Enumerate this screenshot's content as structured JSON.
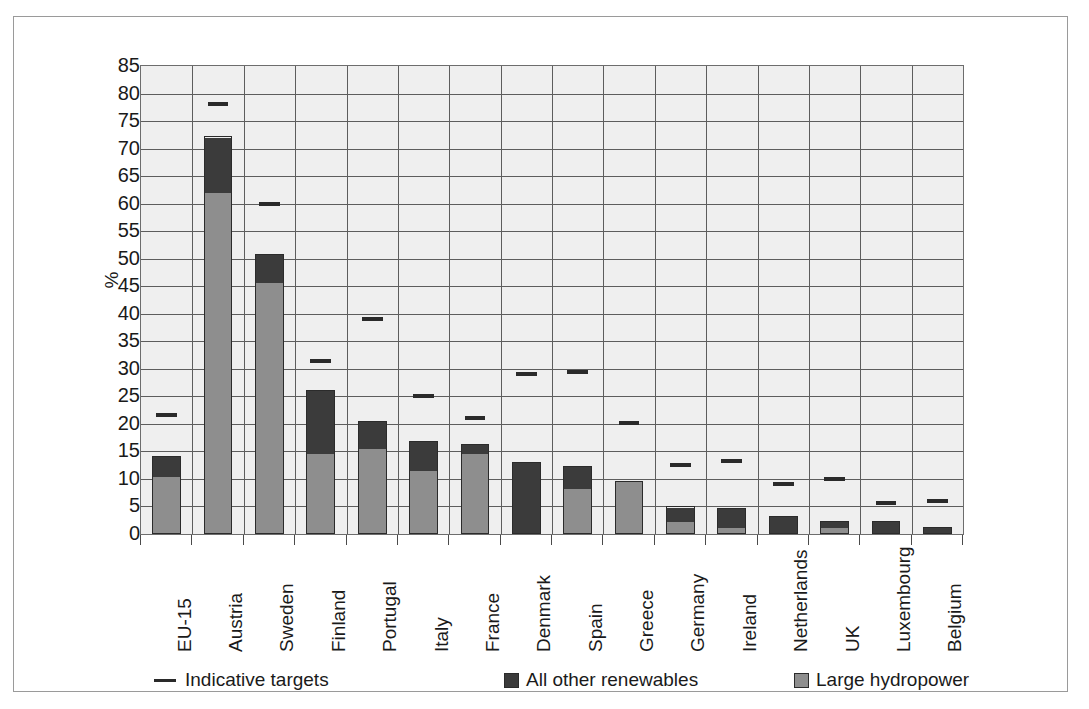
{
  "figure": {
    "ylabel": "%",
    "border_color": "#9a9a9a",
    "plot_bg": "#efefef"
  },
  "legend": {
    "items": [
      {
        "label": "Indicative targets",
        "marker": "line",
        "color": "#2a2a2a",
        "icon": "line-marker-icon"
      },
      {
        "label": "All other renewables",
        "marker": "box",
        "color": "#3b3b3b",
        "icon": "square-swatch-icon"
      },
      {
        "label": "Large hydropower",
        "marker": "box",
        "color": "#8e8e8e",
        "icon": "square-swatch-icon"
      }
    ]
  },
  "chart_data": {
    "type": "bar",
    "title": "",
    "subtitle": "",
    "xlabel": "",
    "ylabel": "%",
    "ylim": [
      0,
      85
    ],
    "ytick_step": 5,
    "yticks": [
      0,
      5,
      10,
      15,
      20,
      25,
      30,
      35,
      40,
      45,
      50,
      55,
      60,
      65,
      70,
      75,
      80,
      85
    ],
    "grid": true,
    "grid_axis": "y",
    "legend_position": "bottom",
    "stacked": true,
    "categories": [
      "EU-15",
      "Austria",
      "Sweden",
      "Finland",
      "Portugal",
      "Italy",
      "France",
      "Denmark",
      "Spain",
      "Greece",
      "Germany",
      "Ireland",
      "Netherlands",
      "UK",
      "Luxembourg",
      "Belgium"
    ],
    "series": [
      {
        "name": "Large hydropower",
        "color": "#8e8e8e",
        "values": [
          10.4,
          62.0,
          45.8,
          14.5,
          15.6,
          11.5,
          14.7,
          0.0,
          8.3,
          9.6,
          2.1,
          1.0,
          0.0,
          1.0,
          0.0,
          0.0
        ]
      },
      {
        "name": "All other renewables",
        "color": "#3b3b3b",
        "values": [
          3.7,
          10.2,
          5.0,
          11.7,
          4.9,
          5.4,
          1.6,
          13.0,
          4.0,
          0.0,
          2.9,
          3.8,
          3.2,
          1.4,
          2.4,
          1.3
        ]
      }
    ],
    "totals": [
      14.1,
      72.2,
      50.8,
      26.2,
      20.5,
      16.9,
      16.3,
      13.0,
      12.3,
      9.6,
      5.0,
      4.8,
      3.2,
      2.4,
      2.4,
      1.3
    ],
    "markers": {
      "name": "Indicative targets",
      "color": "#2a2a2a",
      "values": [
        21.7,
        78.1,
        60.0,
        31.5,
        39.0,
        25.0,
        21.0,
        29.0,
        29.4,
        20.1,
        12.5,
        13.2,
        9.0,
        9.9,
        5.7,
        6.0
      ]
    }
  }
}
